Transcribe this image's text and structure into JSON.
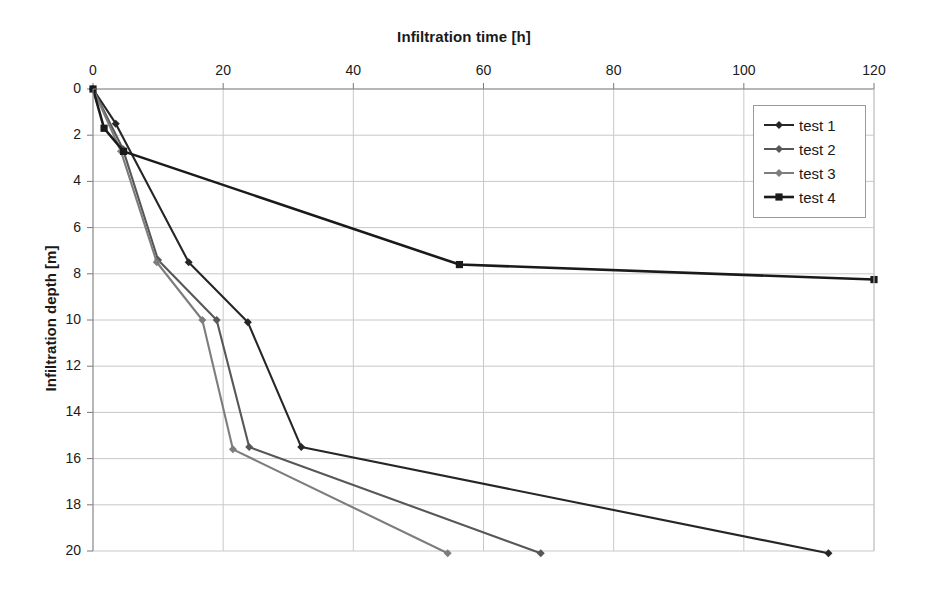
{
  "chart_data": {
    "type": "line",
    "title": "Infiltration time [h]",
    "xlabel": "Infiltration time [h]",
    "ylabel": "Infiltration depth [m]",
    "xlim": [
      0,
      120
    ],
    "ylim": [
      20,
      0
    ],
    "y_inverted": true,
    "x_ticks": [
      0,
      20,
      40,
      60,
      80,
      100,
      120
    ],
    "y_ticks": [
      0,
      2,
      4,
      6,
      8,
      10,
      12,
      14,
      16,
      18,
      20
    ],
    "x_tick_labels": [
      "0",
      "20",
      "40",
      "60",
      "80",
      "100",
      "120"
    ],
    "y_tick_labels": [
      "0",
      "2",
      "4",
      "6",
      "8",
      "10",
      "12",
      "14",
      "16",
      "18",
      "20"
    ],
    "grid": true,
    "grid_color": "#c8c8c8",
    "legend_position": "top-right",
    "series": [
      {
        "name": "test 1",
        "color": "#262626",
        "marker": "diamond",
        "x": [
          0,
          3.5,
          14.7,
          23.8,
          32,
          113
        ],
        "y": [
          0,
          1.5,
          7.5,
          10.1,
          15.5,
          20.1
        ]
      },
      {
        "name": "test 2",
        "color": "#575757",
        "marker": "diamond",
        "x": [
          0,
          4.6,
          10.0,
          19.0,
          24.0,
          68.8
        ],
        "y": [
          0,
          2.6,
          7.4,
          10.0,
          15.5,
          20.1
        ]
      },
      {
        "name": "test 3",
        "color": "#7d7d7d",
        "marker": "diamond",
        "x": [
          0,
          4.3,
          9.8,
          16.8,
          21.5,
          54.5
        ],
        "y": [
          0,
          2.7,
          7.5,
          10.0,
          15.6,
          20.1
        ]
      },
      {
        "name": "test 4",
        "color": "#1a1a1a",
        "marker": "square",
        "x": [
          0,
          1.7,
          4.7,
          56.3,
          120
        ],
        "y": [
          0,
          1.7,
          2.7,
          7.6,
          8.25
        ]
      }
    ]
  },
  "legend": {
    "items": [
      {
        "label": "test 1"
      },
      {
        "label": "test 2"
      },
      {
        "label": "test 3"
      },
      {
        "label": "test 4"
      }
    ]
  }
}
